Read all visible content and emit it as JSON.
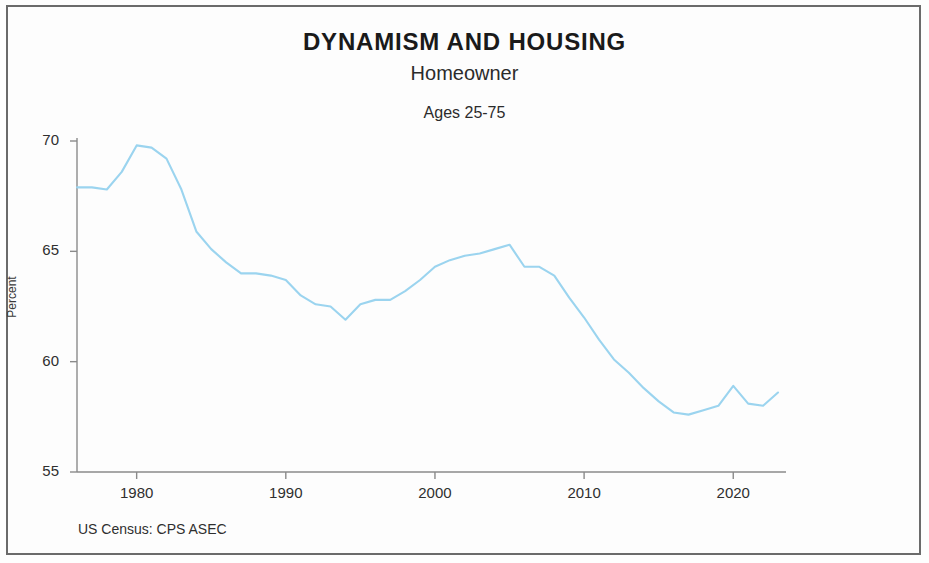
{
  "figure": {
    "title": "DYNAMISM AND HOUSING",
    "subtitle": "Homeowner",
    "subtitle2": "Ages 25-75",
    "source": "US Census: CPS ASEC",
    "ylabel": "Percent",
    "line_color": "#9bd4ef",
    "axis_color": "#8a8a8a",
    "border_color": "#6b6b6b"
  },
  "chart_data": {
    "type": "line",
    "title": "DYNAMISM AND HOUSING",
    "subtitle": "Homeowner",
    "annotations": [
      "Ages 25-75",
      "US Census: CPS ASEC"
    ],
    "xlabel": "",
    "ylabel": "Percent",
    "xlim": [
      1976,
      2023
    ],
    "ylim": [
      55,
      70
    ],
    "yticks": [
      55,
      60,
      65,
      70
    ],
    "xticks": [
      1980,
      1990,
      2000,
      2010,
      2020
    ],
    "ytick_labels": [
      "55",
      "60",
      "65",
      "70"
    ],
    "xtick_labels": [
      "1980",
      "1990",
      "2000",
      "2010",
      "2020"
    ],
    "grid": false,
    "legend": null,
    "series": [
      {
        "name": "Homeowner rate, ages 25-75",
        "x": [
          1976,
          1977,
          1978,
          1979,
          1980,
          1981,
          1982,
          1983,
          1984,
          1985,
          1986,
          1987,
          1988,
          1989,
          1990,
          1991,
          1992,
          1993,
          1994,
          1995,
          1996,
          1997,
          1998,
          1999,
          2000,
          2001,
          2002,
          2003,
          2004,
          2005,
          2006,
          2007,
          2008,
          2009,
          2010,
          2011,
          2012,
          2013,
          2014,
          2015,
          2016,
          2017,
          2018,
          2019,
          2020,
          2021,
          2022,
          2023
        ],
        "values": [
          67.9,
          67.9,
          67.8,
          68.6,
          69.8,
          69.7,
          69.2,
          67.8,
          65.9,
          65.1,
          64.5,
          64.0,
          64.0,
          63.9,
          63.7,
          63.0,
          62.6,
          62.5,
          61.9,
          62.6,
          62.8,
          62.8,
          63.2,
          63.7,
          64.3,
          64.6,
          64.8,
          64.9,
          65.1,
          65.3,
          64.3,
          64.3,
          63.9,
          62.9,
          62.0,
          61.0,
          60.1,
          59.5,
          58.8,
          58.2,
          57.7,
          57.6,
          57.8,
          58.0,
          58.9,
          58.1,
          58.0,
          58.6
        ]
      }
    ]
  }
}
